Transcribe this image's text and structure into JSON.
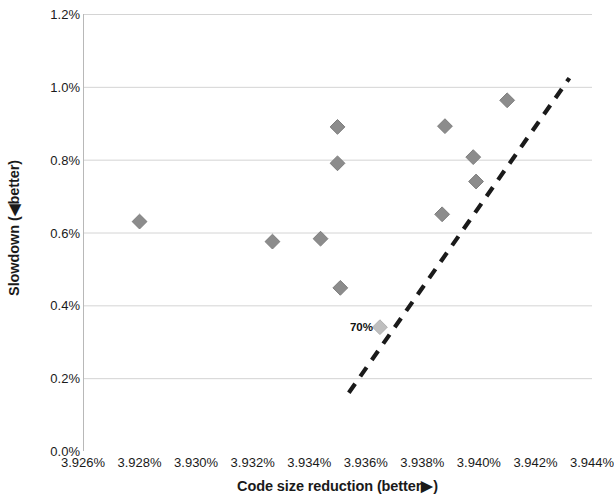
{
  "chart_data": {
    "type": "scatter",
    "title": "",
    "xlabel": "Code size reduction   (better▶)",
    "ylabel": "Slowdown  (◀better)",
    "xlim": [
      3.926,
      3.944
    ],
    "ylim": [
      0.0,
      1.2
    ],
    "x_unit": "%",
    "y_unit": "%",
    "grid": "horizontal",
    "legend": "none",
    "x_tick_labels": [
      "3.926%",
      "3.928%",
      "3.930%",
      "3.932%",
      "3.934%",
      "3.936%",
      "3.938%",
      "3.940%",
      "3.942%",
      "3.944%"
    ],
    "x_tick_values": [
      3.926,
      3.928,
      3.93,
      3.932,
      3.934,
      3.936,
      3.938,
      3.94,
      3.942,
      3.944
    ],
    "y_tick_labels": [
      "0.0%",
      "0.2%",
      "0.4%",
      "0.6%",
      "0.8%",
      "1.0%",
      "1.2%"
    ],
    "y_tick_values": [
      0.0,
      0.2,
      0.4,
      0.6,
      0.8,
      1.0,
      1.2
    ],
    "marker": "diamond",
    "marker_color": "#8c8c8c",
    "highlight_marker_color": "#bfbfbf",
    "points": [
      {
        "x": 3.928,
        "y": 0.63,
        "label": ""
      },
      {
        "x": 3.9327,
        "y": 0.575,
        "label": ""
      },
      {
        "x": 3.9344,
        "y": 0.583,
        "label": ""
      },
      {
        "x": 3.935,
        "y": 0.89,
        "label": ""
      },
      {
        "x": 3.935,
        "y": 0.79,
        "label": ""
      },
      {
        "x": 3.9351,
        "y": 0.448,
        "label": ""
      },
      {
        "x": 3.9365,
        "y": 0.34,
        "label": "70%",
        "highlight": true
      },
      {
        "x": 3.9387,
        "y": 0.65,
        "label": ""
      },
      {
        "x": 3.9388,
        "y": 0.892,
        "label": ""
      },
      {
        "x": 3.9398,
        "y": 0.807,
        "label": ""
      },
      {
        "x": 3.9399,
        "y": 0.74,
        "label": ""
      },
      {
        "x": 3.941,
        "y": 0.963,
        "label": ""
      }
    ],
    "trend_line": {
      "style": "dashed",
      "color": "#1a1a1a",
      "x_start": 3.9354,
      "y_start": 0.16,
      "x_end": 3.9432,
      "y_end": 1.024
    },
    "annotations": [
      {
        "text": "70%",
        "x": 3.9365,
        "y": 0.34
      }
    ]
  },
  "axes": {
    "x_title": "Code size reduction   (better▶)",
    "y_title": "Slowdown  (◀better)"
  }
}
